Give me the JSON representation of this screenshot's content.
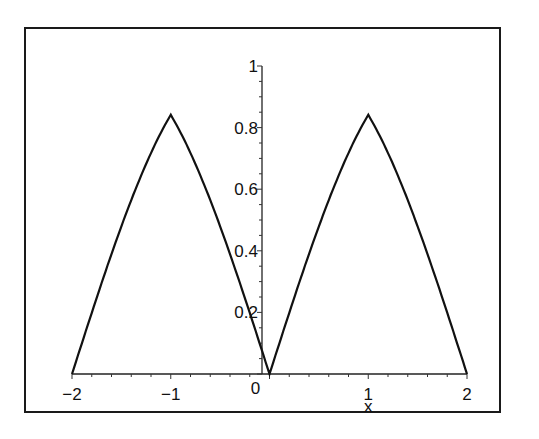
{
  "chart_data": {
    "type": "line",
    "title": "",
    "xlabel": "x",
    "ylabel": "",
    "xlim": [
      -2,
      2
    ],
    "ylim": [
      0,
      1
    ],
    "grid": false,
    "legend": null,
    "x_ticks": [
      "-2",
      "-1",
      "0",
      "1",
      "2"
    ],
    "y_ticks": [
      "0.2",
      "0.4",
      "0.6",
      "0.8",
      "1"
    ],
    "series": [
      {
        "name": "f(x)",
        "color": "#111111",
        "x": [
          -2,
          -1.8,
          -1.6,
          -1.4,
          -1.2,
          -1,
          -0.8,
          -0.6,
          -0.4,
          -0.2,
          0,
          0.2,
          0.4,
          0.6,
          0.8,
          1,
          1.2,
          1.4,
          1.6,
          1.8,
          2
        ],
        "y": [
          0,
          0.199,
          0.389,
          0.565,
          0.717,
          0.841,
          0.717,
          0.565,
          0.389,
          0.199,
          0,
          0.199,
          0.389,
          0.565,
          0.717,
          0.841,
          0.717,
          0.565,
          0.389,
          0.199,
          0
        ]
      }
    ]
  }
}
